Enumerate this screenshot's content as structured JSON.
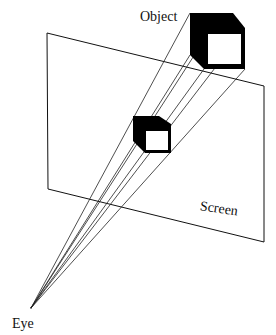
{
  "diagram": {
    "labels": {
      "object": "Object",
      "screen": "Screen",
      "eye": "Eye"
    },
    "colors": {
      "stroke": "#111111",
      "fill_dark": "#000000",
      "background": "#ffffff"
    },
    "eye_point": [
      31,
      308
    ],
    "screen_plane": [
      [
        47,
        33
      ],
      [
        264,
        86
      ],
      [
        264,
        242
      ],
      [
        48,
        189
      ]
    ],
    "object_cube": {
      "outer": [
        [
          190,
          13
        ],
        [
          233,
          13
        ],
        [
          245,
          28
        ],
        [
          245,
          69
        ],
        [
          204,
          69
        ],
        [
          190,
          55
        ]
      ],
      "inner_face": [
        [
          208,
          34
        ],
        [
          241,
          34
        ],
        [
          241,
          64
        ],
        [
          208,
          64
        ]
      ]
    },
    "projected_cube": {
      "outer": [
        [
          133,
          116
        ],
        [
          159,
          116
        ],
        [
          171,
          124
        ],
        [
          171,
          153
        ],
        [
          145,
          153
        ],
        [
          133,
          141
        ]
      ],
      "inner_face": [
        [
          146,
          131
        ],
        [
          168,
          131
        ],
        [
          168,
          150
        ],
        [
          146,
          150
        ]
      ]
    },
    "rays_to": [
      [
        190,
        13
      ],
      [
        190,
        55
      ],
      [
        204,
        69
      ],
      [
        208,
        34
      ],
      [
        241,
        34
      ],
      [
        245,
        69
      ]
    ]
  }
}
